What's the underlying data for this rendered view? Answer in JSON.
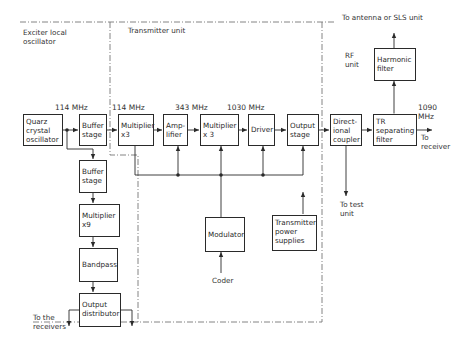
{
  "regions": {
    "exciter": "Exciter local\noscillator",
    "transmitter": "Transmitter unit",
    "rf": "RF\nunit"
  },
  "blocks": {
    "quarz_oscillator": "Quarz\ncrystal\noscillator",
    "buffer_stage_1": "Buffer\nstage",
    "buffer_stage_2": "Buffer\nstage",
    "multiplier_x9": "Multiplier\nx9",
    "bandpass": "Bandpass",
    "output_distributor": "Output\ndistributor",
    "multiplier_x3_1": "Multiplier\nx3",
    "amplifier": "Amp-\nlifier",
    "multiplier_x3_2": "Multiplier\nx 3",
    "driver": "Driver",
    "output_stage": "Output\nstage",
    "modulator": "Modulator",
    "power_supplies": "Transmitter\npower\nsupplies",
    "directional_coupler": "Direct-\nional\ncoupler",
    "tr_filter": "TR\nseparating\nfilter",
    "harmonic_filter": "Harmonic\nfilter"
  },
  "frequencies": {
    "f1": "114 MHz",
    "f2": "114 MHz",
    "f3": "343 MHz",
    "f4": "1030 MHz",
    "f5": "1090\nMHz"
  },
  "terminals": {
    "antenna": "To antenna or SLS unit",
    "receiver": "To\nreceiver",
    "test_unit": "To test\nunit",
    "coder": "Coder",
    "receivers": "To the\nreceivers"
  },
  "colors": {
    "line": "#2a2a2a",
    "dashed": "#777777",
    "background": "#ffffff"
  }
}
